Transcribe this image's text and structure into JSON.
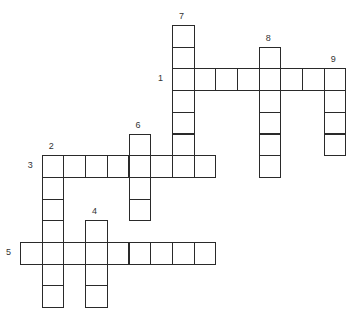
{
  "puzzle": {
    "type": "crossword",
    "grid": {
      "origin_x": 20,
      "origin_y": 25,
      "cell": 21.7
    },
    "entries": [
      {
        "number": "1",
        "direction": "across",
        "row": 2,
        "col": 7,
        "length": 8,
        "label_dx": -14,
        "label_dy": 6
      },
      {
        "number": "3",
        "direction": "across",
        "row": 6,
        "col": 1,
        "length": 8,
        "label_dx": -14,
        "label_dy": 6
      },
      {
        "number": "5",
        "direction": "across",
        "row": 10,
        "col": 0,
        "length": 9,
        "label_dx": -14,
        "label_dy": 6
      },
      {
        "number": "2",
        "direction": "down",
        "row": 6,
        "col": 1,
        "length": 7,
        "label_dx": 7,
        "label_dy": -13
      },
      {
        "number": "4",
        "direction": "down",
        "row": 9,
        "col": 3,
        "length": 4,
        "label_dx": 7,
        "label_dy": -13
      },
      {
        "number": "6",
        "direction": "down",
        "row": 5,
        "col": 5,
        "length": 4,
        "label_dx": 7,
        "label_dy": -13
      },
      {
        "number": "7",
        "direction": "down",
        "row": 0,
        "col": 7,
        "length": 7,
        "label_dx": 7,
        "label_dy": -13
      },
      {
        "number": "8",
        "direction": "down",
        "row": 1,
        "col": 11,
        "length": 6,
        "label_dx": 7,
        "label_dy": -13
      },
      {
        "number": "9",
        "direction": "down",
        "row": 2,
        "col": 14,
        "length": 4,
        "label_dx": 7,
        "label_dy": -13
      }
    ]
  }
}
